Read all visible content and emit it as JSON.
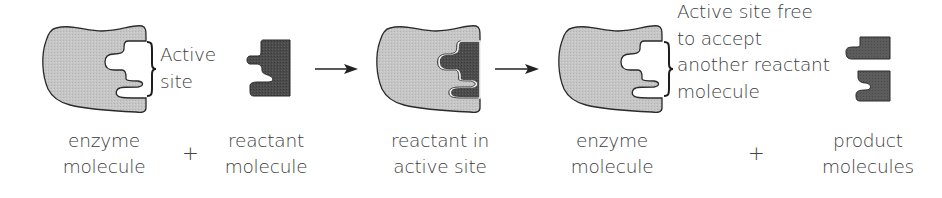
{
  "diagram": {
    "type": "enzyme-substrate reaction (lock and key)",
    "colors": {
      "enzyme_fill": "#c4c4c4",
      "reactant_fill": "#4a4a4a",
      "product_fill": "#5a5a5a",
      "outline": "#2a2a2a",
      "text": "#3c3c3c"
    },
    "annotations": {
      "active_site": [
        "Active",
        "site"
      ],
      "active_site_free": [
        "Active site free",
        "to accept",
        "another reactant",
        "molecule"
      ]
    },
    "stages": [
      {
        "id": "enzyme",
        "label": [
          "enzyme",
          "molecule"
        ]
      },
      {
        "id": "reactant",
        "label": [
          "reactant",
          "molecule"
        ]
      },
      {
        "id": "complex",
        "label": [
          "reactant in",
          "active site"
        ]
      },
      {
        "id": "enzyme-free",
        "label": [
          "enzyme",
          "molecule"
        ]
      },
      {
        "id": "products",
        "label": [
          "product",
          "molecules"
        ]
      }
    ],
    "operators": {
      "plus_1": "+",
      "plus_2": "+"
    },
    "arrows": [
      {
        "from": "reactant",
        "to": "complex"
      },
      {
        "from": "complex",
        "to": "enzyme-free"
      }
    ]
  }
}
